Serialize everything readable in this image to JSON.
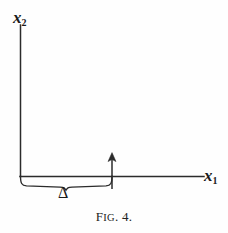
{
  "figure": {
    "caption_prefix": "F",
    "caption_smallcaps": "IG",
    "caption_suffix": ". 4.",
    "caption_full": "Fig. 4.",
    "axes": {
      "vertical": {
        "label_base": "x",
        "label_subscript": "2",
        "label_text": "x2",
        "name": "x2-axis",
        "from": [
          20,
          176
        ],
        "to": [
          20,
          25
        ]
      },
      "horizontal": {
        "label_base": "x",
        "label_subscript": "1",
        "label_text": "x1",
        "name": "x1-axis",
        "from": [
          20,
          176
        ],
        "to": [
          204,
          176
        ]
      }
    },
    "annotations": {
      "brace": {
        "name": "delta-brace",
        "label": "Δ",
        "span_start_x": 20,
        "span_end_x": 112,
        "baseline_y": 176,
        "depth_y": 188
      },
      "arrow": {
        "name": "impulse-arrow",
        "x": 112,
        "tail_y": 189,
        "tip_y": 153,
        "direction": "up"
      }
    },
    "style": {
      "background": "#fefefe",
      "stroke": "#2b2b2b",
      "text": "#1a1a1a",
      "stroke_width": 1.4
    }
  }
}
